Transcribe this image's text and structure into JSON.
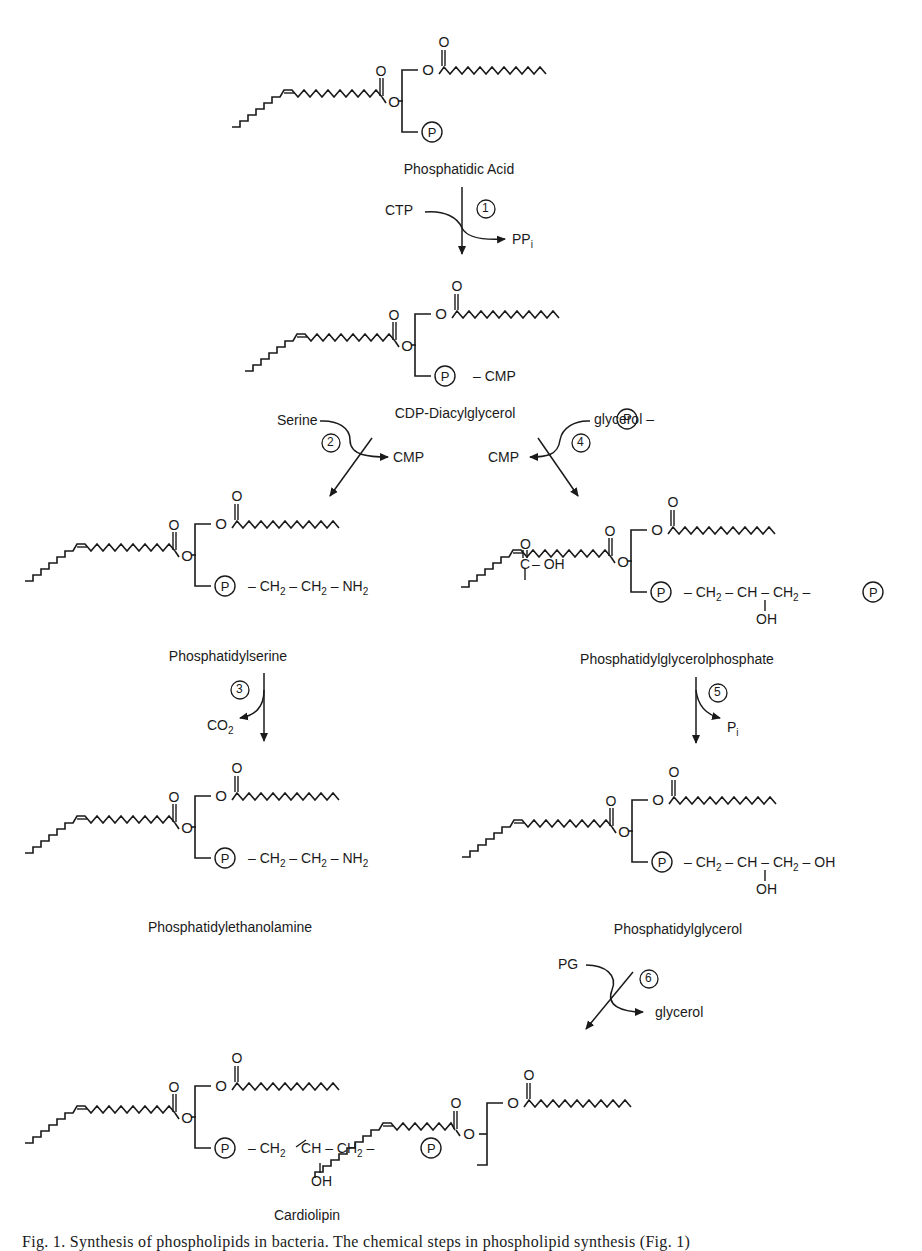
{
  "figure": {
    "caption": "Fig. 1. Synthesis of phospholipids in bacteria. The chemical steps in phospholipid synthesis (Fig. 1)"
  },
  "compounds": {
    "phosphatidic_acid": "Phosphatidic Acid",
    "cdp_dag": "CDP-Diacylglycerol",
    "ps": "Phosphatidylserine",
    "pgp": "Phosphatidylglycerolphosphate",
    "pe": "Phosphatidylethanolamine",
    "pg": "Phosphatidylglycerol",
    "cl": "Cardiolipin"
  },
  "steps": [
    {
      "number": "1",
      "input": "CTP",
      "output": "PP",
      "output_sub": "i"
    },
    {
      "number": "2",
      "input": "Serine",
      "output": "CMP"
    },
    {
      "number": "3",
      "input": "",
      "output": "CO",
      "output_sub": "2"
    },
    {
      "number": "4",
      "input": "glycerol –",
      "output": "CMP"
    },
    {
      "number": "5",
      "input": "",
      "output": "P",
      "output_sub": "i"
    },
    {
      "number": "6",
      "input": "PG",
      "output": "glycerol"
    }
  ],
  "groups": {
    "phosphate": "P",
    "cmp_tail": "– CMP",
    "oxygen": "O",
    "ps_head": {
      "ch2": "CH",
      "sub2": "2",
      "c": "C",
      "oh": "– OH",
      "nh2": "NH",
      "dash": "–"
    },
    "pe_head": {
      "ch2": "CH",
      "sub2": "2",
      "nh2": "NH",
      "dash": "–"
    },
    "pgp_head": {
      "ch2": "CH",
      "sub2": "2",
      "ch": "CH",
      "oh": "OH",
      "dash": "–"
    },
    "pg_head": {
      "ch2": "CH",
      "sub2": "2",
      "ch": "CH",
      "oh": "OH",
      "dash": "–"
    }
  },
  "colors": {
    "ink": "#1a1a1a",
    "background": "#ffffff"
  }
}
